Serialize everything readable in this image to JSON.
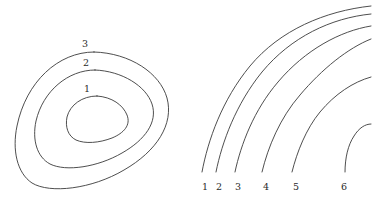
{
  "figure": {
    "background_color": "#ffffff",
    "stroke_color": "#3a3a3a",
    "label_color": "#2a2a2a",
    "width": 374,
    "height": 210
  },
  "left_panel": {
    "name": "nested-closed-contours",
    "description": "Three nested closed teardrop-shaped contour curves",
    "contour_count": 3,
    "contours": [
      {
        "id": "contour-1",
        "label": "1",
        "label_x": 87,
        "label_y": 92,
        "rank": "innermost",
        "path": "M 97 96 C 112 97 123 105 127 115 C 131 125 124 133 112 138 C 99 143 85 144 76 140 C 68 136 65 127 67 117 C 70 105 82 96 97 96 Z"
      },
      {
        "id": "contour-2",
        "label": "2",
        "label_x": 86,
        "label_y": 66,
        "rank": "middle",
        "path": "M 95 70 C 122 71 146 86 152 104 C 158 122 145 140 122 153 C 98 167 66 172 50 164 C 37 157 32 140 36 121 C 43 91 68 70 95 70 Z"
      },
      {
        "id": "contour-3",
        "label": "3",
        "label_x": 85,
        "label_y": 47,
        "rank": "outermost",
        "path": "M 94 52 C 130 53 160 73 167 98 C 174 124 157 151 124 170 C 92 189 50 194 32 183 C 17 173 12 150 17 126 C 26 82 58 52 94 52 Z"
      }
    ]
  },
  "right_panel": {
    "name": "nested-arc-family",
    "description": "Six nested open arcs rising from lower-left to upper-right",
    "arc_count": 6,
    "arcs": [
      {
        "id": "arc-1",
        "label": "1",
        "label_x": 205,
        "label_y": 190,
        "path": "M 202 172 C 208 140 222 100 250 66 C 280 30 325 11 371 6"
      },
      {
        "id": "arc-2",
        "label": "2",
        "label_x": 219,
        "label_y": 190,
        "path": "M 216 172 C 222 142 236 104 262 72 C 291 37 331 18 371 14"
      },
      {
        "id": "arc-3",
        "label": "3",
        "label_x": 238,
        "label_y": 190,
        "path": "M 235 172 C 241 144 254 110 278 82 C 305 50 340 31 371 26"
      },
      {
        "id": "arc-4",
        "label": "4",
        "label_x": 266,
        "label_y": 190,
        "path": "M 262 172 C 268 147 280 118 300 95 C 322 69 348 48 371 39"
      },
      {
        "id": "arc-5",
        "label": "5",
        "label_x": 296,
        "label_y": 190,
        "path": "M 292 172 C 297 152 306 129 320 112 C 335 94 353 82 371 77"
      },
      {
        "id": "arc-6",
        "label": "6",
        "label_x": 344,
        "label_y": 190,
        "path": "M 345 172 C 345 158 348 145 354 136 C 359 128 365 124 371 124"
      }
    ]
  }
}
